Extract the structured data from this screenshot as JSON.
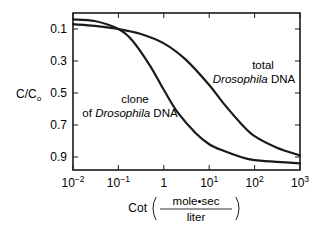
{
  "chart_data": {
    "type": "line",
    "title": "",
    "xlabel": "Cot",
    "xlabel_units": {
      "numerator": "mole•sec",
      "denominator": "liter"
    },
    "ylabel": "C/C",
    "ylabel_sub": "o",
    "xscale": "log",
    "xlim": [
      0.01,
      1000
    ],
    "ylim": [
      1.0,
      0.0
    ],
    "y_inverted": true,
    "grid": false,
    "legend": "none (curves labeled inline)",
    "x_ticks": [
      {
        "base": "10",
        "exp": "−2",
        "value": 0.01
      },
      {
        "base": "10",
        "exp": "−1",
        "value": 0.1
      },
      {
        "base": "1",
        "exp": "",
        "value": 1
      },
      {
        "base": "10",
        "exp": "1",
        "value": 10
      },
      {
        "base": "10",
        "exp": "2",
        "value": 100
      },
      {
        "base": "10",
        "exp": "3",
        "value": 1000
      }
    ],
    "y_ticks": [
      "0.1",
      "0.3",
      "0.5",
      "0.7",
      "0.9"
    ],
    "y_tick_values": [
      0.1,
      0.3,
      0.5,
      0.7,
      0.9
    ],
    "series": [
      {
        "name": "clone of Drosophila DNA",
        "label_line1": "clone",
        "label_line2_prefix": "of ",
        "label_line2_italic": "Drosophila",
        "label_line2_suffix": " DNA",
        "x": [
          0.01,
          0.03,
          0.1,
          0.2,
          0.5,
          1,
          2,
          5,
          10,
          20,
          50,
          100,
          300,
          1000
        ],
        "y": [
          0.04,
          0.05,
          0.1,
          0.17,
          0.33,
          0.48,
          0.62,
          0.75,
          0.82,
          0.86,
          0.9,
          0.92,
          0.93,
          0.94
        ]
      },
      {
        "name": "total Drosophila DNA",
        "label_line1": "total",
        "label_line2_prefix": "",
        "label_line2_italic": "Drosophila",
        "label_line2_suffix": " DNA",
        "x": [
          0.01,
          0.03,
          0.1,
          0.3,
          1,
          3,
          10,
          20,
          50,
          100,
          300,
          1000
        ],
        "y": [
          0.07,
          0.08,
          0.1,
          0.13,
          0.19,
          0.29,
          0.45,
          0.56,
          0.69,
          0.77,
          0.84,
          0.89
        ]
      }
    ]
  }
}
